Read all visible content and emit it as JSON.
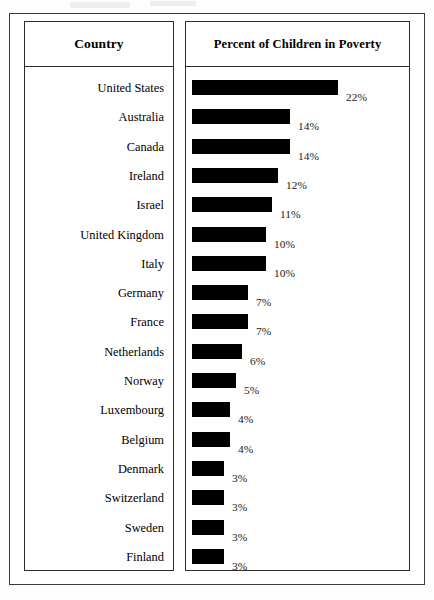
{
  "figure": {
    "left_panel_header": "Country",
    "right_panel_header": "Percent of Children in Poverty"
  },
  "chart_data": {
    "type": "bar",
    "orientation": "horizontal",
    "title": "Percent of Children in Poverty",
    "xlabel": "",
    "ylabel": "Country",
    "value_suffix": "%",
    "grid": false,
    "legend": null,
    "xlim": [
      0,
      22
    ],
    "categories": [
      "United States",
      "Australia",
      "Canada",
      "Ireland",
      "Israel",
      "United Kingdom",
      "Italy",
      "Germany",
      "France",
      "Netherlands",
      "Norway",
      "Luxembourg",
      "Belgium",
      "Denmark",
      "Switzerland",
      "Sweden",
      "Finland"
    ],
    "values": [
      22,
      14,
      14,
      12,
      11,
      10,
      10,
      7,
      7,
      6,
      5,
      4,
      4,
      3,
      3,
      3,
      3
    ],
    "labels": [
      "22%",
      "14%",
      "14%",
      "12%",
      "11%",
      "10%",
      "10%",
      "7%",
      "7%",
      "6%",
      "5%",
      "4%",
      "4%",
      "3%",
      "3%",
      "3%",
      "3%"
    ],
    "bar_color": "#000000"
  },
  "rows": [
    {
      "country": "United States",
      "value": 22,
      "label": "22%",
      "bar_px": 146
    },
    {
      "country": "Australia",
      "value": 14,
      "label": "14%",
      "bar_px": 98
    },
    {
      "country": "Canada",
      "value": 14,
      "label": "14%",
      "bar_px": 98
    },
    {
      "country": "Ireland",
      "value": 12,
      "label": "12%",
      "bar_px": 86
    },
    {
      "country": "Israel",
      "value": 11,
      "label": "11%",
      "bar_px": 80
    },
    {
      "country": "United Kingdom",
      "value": 10,
      "label": "10%",
      "bar_px": 74
    },
    {
      "country": "Italy",
      "value": 10,
      "label": "10%",
      "bar_px": 74
    },
    {
      "country": "Germany",
      "value": 7,
      "label": "7%",
      "bar_px": 56
    },
    {
      "country": "France",
      "value": 7,
      "label": "7%",
      "bar_px": 56
    },
    {
      "country": "Netherlands",
      "value": 6,
      "label": "6%",
      "bar_px": 50
    },
    {
      "country": "Norway",
      "value": 5,
      "label": "5%",
      "bar_px": 44
    },
    {
      "country": "Luxembourg",
      "value": 4,
      "label": "4%",
      "bar_px": 38
    },
    {
      "country": "Belgium",
      "value": 4,
      "label": "4%",
      "bar_px": 38
    },
    {
      "country": "Denmark",
      "value": 3,
      "label": "3%",
      "bar_px": 32
    },
    {
      "country": "Switzerland",
      "value": 3,
      "label": "3%",
      "bar_px": 32
    },
    {
      "country": "Sweden",
      "value": 3,
      "label": "3%",
      "bar_px": 32
    },
    {
      "country": "Finland",
      "value": 3,
      "label": "3%",
      "bar_px": 32
    }
  ]
}
